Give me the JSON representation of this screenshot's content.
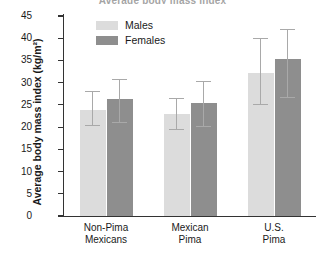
{
  "figure": {
    "title_cropped": "Average body mass index"
  },
  "legend": {
    "position": "top-left-inside",
    "entries": [
      {
        "label": "Males",
        "color": "#dcdcdc",
        "swatch_name": "legend-swatch-males"
      },
      {
        "label": "Females",
        "color": "#8e8e8e",
        "swatch_name": "legend-swatch-females"
      }
    ]
  },
  "chart_data": {
    "type": "bar",
    "title": "Average body mass index",
    "xlabel": "",
    "ylabel": "Average body mass index (kg/m²)",
    "ylim": [
      0,
      45
    ],
    "ytick_step": 5,
    "yticks": [
      0,
      5,
      10,
      15,
      20,
      25,
      30,
      35,
      40,
      45
    ],
    "ytick_labels": [
      "0",
      "5",
      "10",
      "15",
      "20",
      "25",
      "30",
      "35",
      "40",
      "45"
    ],
    "grid": false,
    "error_bars": true,
    "error_bar_style": "capped-both-ends",
    "categories": [
      "Non-Pima\nMexicans",
      "Mexican\nPima",
      "U.S.\nPima"
    ],
    "categories_flat": [
      "Non-Pima Mexicans",
      "Mexican Pima",
      "U.S. Pima"
    ],
    "series": [
      {
        "name": "Males",
        "color": "#dcdcdc",
        "values": [
          23.9,
          23.0,
          32.2
        ],
        "err_low": [
          20.4,
          19.5,
          25.0
        ],
        "err_high": [
          28.1,
          26.4,
          40.0
        ]
      },
      {
        "name": "Females",
        "color": "#8e8e8e",
        "values": [
          26.4,
          25.5,
          35.3
        ],
        "err_low": [
          21.0,
          20.1,
          26.7
        ],
        "err_high": [
          30.8,
          30.2,
          42.0
        ]
      }
    ]
  },
  "colors": {
    "axis": "#333333",
    "error_bar": "#a9a9a9",
    "background": "#ffffff",
    "text": "#1a1a1a"
  }
}
